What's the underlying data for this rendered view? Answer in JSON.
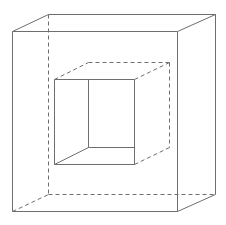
{
  "diagram": {
    "type": "wireframe-nested-cubes",
    "canvas": {
      "width": 226,
      "height": 225,
      "background": "#ffffff"
    },
    "style": {
      "stroke_color": "#6e6e6e",
      "stroke_width": 1,
      "dash_pattern": "4,3"
    },
    "shapes": [
      {
        "name": "outer-cube",
        "vertices": {
          "front_top_left": [
            12,
            31
          ],
          "front_top_right": [
            177,
            31
          ],
          "front_bottom_left": [
            12,
            211
          ],
          "front_bottom_right": [
            177,
            211
          ],
          "back_top_left": [
            48,
            14
          ],
          "back_top_right": [
            215,
            14
          ],
          "back_bottom_left": [
            48,
            194
          ],
          "back_bottom_right": [
            215,
            194
          ]
        },
        "edges": [
          {
            "name": "outer-front-top-edge",
            "from": [
              12,
              31
            ],
            "to": [
              177,
              31
            ],
            "style": "solid"
          },
          {
            "name": "outer-front-bottom-edge",
            "from": [
              12,
              211
            ],
            "to": [
              177,
              211
            ],
            "style": "solid"
          },
          {
            "name": "outer-front-left-edge",
            "from": [
              12,
              31
            ],
            "to": [
              12,
              211
            ],
            "style": "solid"
          },
          {
            "name": "outer-front-right-edge",
            "from": [
              177,
              31
            ],
            "to": [
              177,
              211
            ],
            "style": "solid"
          },
          {
            "name": "outer-back-top-edge",
            "from": [
              48,
              14
            ],
            "to": [
              215,
              14
            ],
            "style": "solid"
          },
          {
            "name": "outer-back-right-edge",
            "from": [
              215,
              14
            ],
            "to": [
              215,
              194
            ],
            "style": "solid"
          },
          {
            "name": "outer-top-left-depth-edge",
            "from": [
              12,
              31
            ],
            "to": [
              48,
              14
            ],
            "style": "solid"
          },
          {
            "name": "outer-top-right-depth-edge",
            "from": [
              177,
              31
            ],
            "to": [
              215,
              14
            ],
            "style": "solid"
          },
          {
            "name": "outer-bottom-right-depth-edge",
            "from": [
              177,
              211
            ],
            "to": [
              215,
              194
            ],
            "style": "solid"
          },
          {
            "name": "outer-back-left-edge-hidden",
            "from": [
              48,
              14
            ],
            "to": [
              48,
              194
            ],
            "style": "dashed"
          },
          {
            "name": "outer-back-bottom-edge-hidden",
            "from": [
              48,
              194
            ],
            "to": [
              215,
              194
            ],
            "style": "dashed"
          },
          {
            "name": "outer-bottom-left-depth-edge-hidden",
            "from": [
              12,
              211
            ],
            "to": [
              48,
              194
            ],
            "style": "dashed"
          }
        ]
      },
      {
        "name": "inner-cube",
        "vertices": {
          "front_top_left": [
            54,
            79
          ],
          "front_top_right": [
            134,
            79
          ],
          "front_bottom_left": [
            54,
            164
          ],
          "front_bottom_right": [
            134,
            164
          ],
          "back_top_left": [
            88,
            62
          ],
          "back_top_right": [
            169,
            62
          ],
          "back_bottom_left": [
            88,
            147
          ],
          "back_bottom_right": [
            169,
            147
          ]
        },
        "edges": [
          {
            "name": "inner-front-top-edge",
            "from": [
              54,
              79
            ],
            "to": [
              134,
              79
            ],
            "style": "solid"
          },
          {
            "name": "inner-front-bottom-edge",
            "from": [
              54,
              164
            ],
            "to": [
              134,
              164
            ],
            "style": "solid"
          },
          {
            "name": "inner-front-left-edge",
            "from": [
              54,
              79
            ],
            "to": [
              54,
              164
            ],
            "style": "solid"
          },
          {
            "name": "inner-front-right-edge",
            "from": [
              134,
              79
            ],
            "to": [
              134,
              164
            ],
            "style": "solid"
          },
          {
            "name": "inner-back-left-edge-visible",
            "from": [
              88,
              79
            ],
            "to": [
              88,
              147
            ],
            "style": "solid"
          },
          {
            "name": "inner-back-bottom-edge-visible",
            "from": [
              88,
              147
            ],
            "to": [
              134,
              147
            ],
            "style": "solid"
          },
          {
            "name": "inner-bottom-left-depth-edge",
            "from": [
              54,
              164
            ],
            "to": [
              88,
              147
            ],
            "style": "solid"
          },
          {
            "name": "inner-top-left-depth-edge-hidden",
            "from": [
              54,
              79
            ],
            "to": [
              88,
              62
            ],
            "style": "dashed"
          },
          {
            "name": "inner-back-top-edge-hidden",
            "from": [
              88,
              62
            ],
            "to": [
              169,
              62
            ],
            "style": "dashed"
          },
          {
            "name": "inner-top-right-depth-edge-hidden",
            "from": [
              134,
              79
            ],
            "to": [
              169,
              62
            ],
            "style": "dashed"
          },
          {
            "name": "inner-back-right-edge-hidden",
            "from": [
              169,
              62
            ],
            "to": [
              169,
              147
            ],
            "style": "dashed"
          },
          {
            "name": "inner-bottom-right-depth-edge-hidden",
            "from": [
              134,
              164
            ],
            "to": [
              169,
              147
            ],
            "style": "dashed"
          }
        ]
      }
    ]
  }
}
